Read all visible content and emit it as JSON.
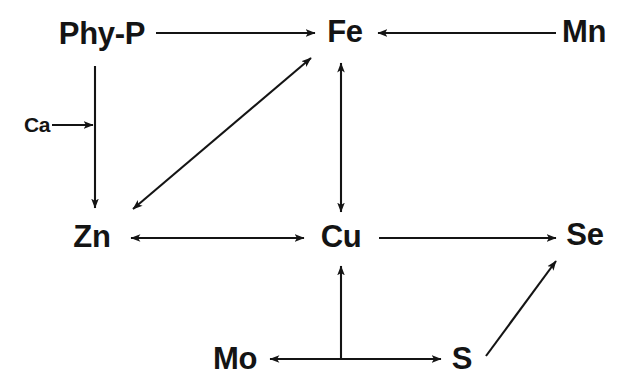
{
  "figure": {
    "kind": "node-link-diagram",
    "background_color": "#ffffff",
    "ink_color": "#141414",
    "width": 624,
    "height": 390
  },
  "nodes": [
    {
      "id": "phy-p",
      "label": "Phy-P",
      "x": 102,
      "y": 33,
      "size": "big"
    },
    {
      "id": "fe",
      "label": "Fe",
      "x": 345,
      "y": 31,
      "size": "big"
    },
    {
      "id": "mn",
      "label": "Mn",
      "x": 584,
      "y": 31,
      "size": "big"
    },
    {
      "id": "ca",
      "label": "Ca",
      "x": 37,
      "y": 124,
      "size": "small"
    },
    {
      "id": "zn",
      "label": "Zn",
      "x": 92,
      "y": 236,
      "size": "big"
    },
    {
      "id": "cu",
      "label": "Cu",
      "x": 341,
      "y": 236,
      "size": "big"
    },
    {
      "id": "se",
      "label": "Se",
      "x": 585,
      "y": 234,
      "size": "big"
    },
    {
      "id": "mo",
      "label": "Mo",
      "x": 235,
      "y": 358,
      "size": "big"
    },
    {
      "id": "s",
      "label": "S",
      "x": 462,
      "y": 358,
      "size": "big"
    }
  ],
  "edges": [
    {
      "id": "phy-p-to-fe",
      "from": "phy-p",
      "to": "fe",
      "direction": "forward",
      "shape": "horizontal"
    },
    {
      "id": "mn-to-fe",
      "from": "mn",
      "to": "fe",
      "direction": "forward",
      "shape": "horizontal"
    },
    {
      "id": "phy-p-to-zn",
      "from": "phy-p",
      "to": "zn",
      "direction": "forward",
      "shape": "vertical"
    },
    {
      "id": "ca-to-phy-p-zn",
      "from": "ca",
      "to": "phy-p-to-zn",
      "direction": "forward",
      "shape": "horizontal"
    },
    {
      "id": "zn-fe",
      "from": "zn",
      "to": "fe",
      "direction": "bidirectional",
      "shape": "diagonal"
    },
    {
      "id": "fe-cu",
      "from": "fe",
      "to": "cu",
      "direction": "bidirectional",
      "shape": "vertical"
    },
    {
      "id": "zn-cu",
      "from": "zn",
      "to": "cu",
      "direction": "bidirectional",
      "shape": "horizontal"
    },
    {
      "id": "cu-to-se",
      "from": "cu",
      "to": "se",
      "direction": "forward",
      "shape": "horizontal"
    },
    {
      "id": "mo-s",
      "from": "mo",
      "to": "s",
      "direction": "bidirectional",
      "shape": "horizontal"
    },
    {
      "id": "mo-s-to-cu",
      "from": "mo-s",
      "to": "cu",
      "direction": "forward",
      "shape": "vertical"
    },
    {
      "id": "s-to-se",
      "from": "s",
      "to": "se",
      "direction": "forward",
      "shape": "diagonal"
    }
  ]
}
